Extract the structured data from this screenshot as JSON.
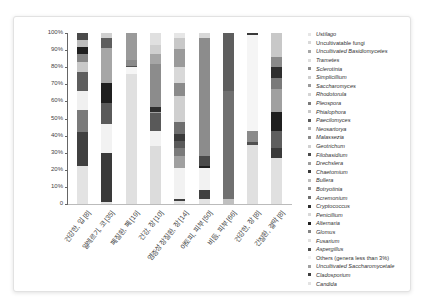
{
  "chart_data": {
    "type": "bar",
    "stacked": true,
    "title": "",
    "xlabel": "",
    "ylabel": "",
    "ylim": [
      0,
      100
    ],
    "yticks": [
      "0",
      "10%",
      "20%",
      "30%",
      "40%",
      "50%",
      "60%",
      "70%",
      "80%",
      "90%",
      "100%"
    ],
    "categories": [
      "건강한, 입 [8]",
      "알레르기, 코 [35]",
      "폐질환, 폐 [19]",
      "건강, 장 [10]",
      "염증성 장질환, 장 [14]",
      "아토피, 피부 [50]",
      "비듬, 피부 [66]",
      "건강한, 장 [8]",
      "간질환, 결막 [8]"
    ],
    "legend": [
      {
        "name": "Ustilago",
        "color": "#e6e6e6",
        "italic": true
      },
      {
        "name": "Uncultivatable fungi",
        "color": "#d9d9d9",
        "italic": false
      },
      {
        "name": "Uncultivated Basidiomycetes",
        "color": "#a6a6a6",
        "italic": true
      },
      {
        "name": "Trametes",
        "color": "#dedede",
        "italic": true
      },
      {
        "name": "Sclerotinia",
        "color": "#8c8c8c",
        "italic": true
      },
      {
        "name": "Simplicillium",
        "color": "#cfcfcf",
        "italic": true
      },
      {
        "name": "Saccharomyces",
        "color": "#9a9a9a",
        "italic": true
      },
      {
        "name": "Rhodotorula",
        "color": "#d4d4d4",
        "italic": true
      },
      {
        "name": "Pleospora",
        "color": "#7a7a7a",
        "italic": true
      },
      {
        "name": "Phialophora",
        "color": "#c8c8c8",
        "italic": true
      },
      {
        "name": "Paecilomyces",
        "color": "#5a5a5a",
        "italic": true
      },
      {
        "name": "Neosartorya",
        "color": "#b0b0b0",
        "italic": true
      },
      {
        "name": "Malassezia",
        "color": "#8a8a8a",
        "italic": true
      },
      {
        "name": "Geotrichum",
        "color": "#d0d0d0",
        "italic": true
      },
      {
        "name": "Filobasidium",
        "color": "#4a4a4a",
        "italic": true
      },
      {
        "name": "Drechslera",
        "color": "#9e9e9e",
        "italic": true
      },
      {
        "name": "Chaetomium",
        "color": "#3a3a3a",
        "italic": true
      },
      {
        "name": "Bullera",
        "color": "#bdbdbd",
        "italic": true
      },
      {
        "name": "Botryotinia",
        "color": "#939393",
        "italic": true
      },
      {
        "name": "Acremonium",
        "color": "#6e6e6e",
        "italic": true
      },
      {
        "name": "Cryptococcus",
        "color": "#2e2e2e",
        "italic": true
      },
      {
        "name": "Penicillium",
        "color": "#d8d8d8",
        "italic": true
      },
      {
        "name": "Alternaria",
        "color": "#1f1f1f",
        "italic": true
      },
      {
        "name": "Glomus",
        "color": "#858585",
        "italic": true
      },
      {
        "name": "Fusarium",
        "color": "#e0e0e0",
        "italic": true
      },
      {
        "name": "Aspergillus",
        "color": "#505050",
        "italic": true
      },
      {
        "name": "Others (genera less than 3%)",
        "color": "#f2f2f2",
        "italic": false
      },
      {
        "name": "Uncultivated Saccharomycetale",
        "color": "#a0a0a0",
        "italic": true
      },
      {
        "name": "Cladosporium",
        "color": "#404040",
        "italic": true
      },
      {
        "name": "Candida",
        "color": "#e3e3e3",
        "italic": true
      }
    ],
    "series_by_bar": [
      {
        "category": "건강한, 입 [8]",
        "segments": [
          {
            "name": "Candida",
            "value": 22,
            "color": "#e3e3e3"
          },
          {
            "name": "Cladosporium",
            "value": 20,
            "color": "#404040"
          },
          {
            "name": "Uncultivated Saccharomycetale",
            "value": 13,
            "color": "#7a7a7a"
          },
          {
            "name": "Others (genera less than 3%)",
            "value": 11,
            "color": "#f0f0f0"
          },
          {
            "name": "Aspergillus",
            "value": 11,
            "color": "#5e5e5e"
          },
          {
            "name": "Fusarium",
            "value": 6,
            "color": "#c8c8c8"
          },
          {
            "name": "Glomus",
            "value": 5,
            "color": "#858585"
          },
          {
            "name": "Alternaria",
            "value": 4,
            "color": "#1f1f1f"
          },
          {
            "name": "Penicillium",
            "value": 4,
            "color": "#bdbdbd"
          },
          {
            "name": "Cryptococcus",
            "value": 4,
            "color": "#4a4a4a"
          }
        ]
      },
      {
        "category": "알레르기, 코 [35]",
        "segments": [
          {
            "name": "Candida",
            "value": 1,
            "color": "#e3e3e3"
          },
          {
            "name": "Cladosporium",
            "value": 29,
            "color": "#3a3a3a"
          },
          {
            "name": "Others (genera less than 3%)",
            "value": 17,
            "color": "#f2f2f2"
          },
          {
            "name": "Aspergillus",
            "value": 12,
            "color": "#5a5a5a"
          },
          {
            "name": "Alternaria",
            "value": 12,
            "color": "#1f1f1f"
          },
          {
            "name": "Penicillium",
            "value": 20,
            "color": "#a6a6a6"
          },
          {
            "name": "Acremonium",
            "value": 6,
            "color": "#5e5e5e"
          },
          {
            "name": "Ustilago",
            "value": 3,
            "color": "#d0d0d0"
          }
        ]
      },
      {
        "category": "폐질환, 폐 [19]",
        "segments": [
          {
            "name": "Candida",
            "value": 76,
            "color": "#e0e0e0"
          },
          {
            "name": "Others (genera less than 3%)",
            "value": 4,
            "color": "#f5f5f5"
          },
          {
            "name": "Aspergillus",
            "value": 1,
            "color": "#505050"
          },
          {
            "name": "Uncultivated Saccharomycetale",
            "value": 3,
            "color": "#8a8a8a"
          },
          {
            "name": "Saccharomyces",
            "value": 16,
            "color": "#9a9a9a"
          }
        ]
      },
      {
        "category": "건강, 장 [10]",
        "segments": [
          {
            "name": "Candida",
            "value": 34,
            "color": "#dcdcdc"
          },
          {
            "name": "Others (genera less than 3%)",
            "value": 9,
            "color": "#f2f2f2"
          },
          {
            "name": "Cladosporium",
            "value": 10,
            "color": "#595959"
          },
          {
            "name": "Aspergillus",
            "value": 1,
            "color": "#a0a0a0"
          },
          {
            "name": "Alternaria",
            "value": 3,
            "color": "#2e2e2e"
          },
          {
            "name": "Saccharomyces",
            "value": 25,
            "color": "#8c8c8c"
          },
          {
            "name": "Sclerotinia",
            "value": 6,
            "color": "#a6a6a6"
          },
          {
            "name": "Trametes",
            "value": 5,
            "color": "#cfcfcf"
          },
          {
            "name": "Ustilago",
            "value": 7,
            "color": "#e0e0e0"
          }
        ]
      },
      {
        "category": "염증성 장질환, 장 [14]",
        "segments": [
          {
            "name": "Candida",
            "value": 2,
            "color": "#e3e3e3"
          },
          {
            "name": "Cladosporium",
            "value": 1,
            "color": "#404040"
          },
          {
            "name": "Others (genera less than 3%)",
            "value": 18,
            "color": "#f2f2f2"
          },
          {
            "name": "Glomus",
            "value": 7,
            "color": "#a0a0a0"
          },
          {
            "name": "Alternaria",
            "value": 5,
            "color": "#7a7a7a"
          },
          {
            "name": "Cryptococcus",
            "value": 4,
            "color": "#5a5a5a"
          },
          {
            "name": "Chaetomium",
            "value": 4,
            "color": "#3a3a3a"
          },
          {
            "name": "Filobasidium",
            "value": 7,
            "color": "#6e6e6e"
          },
          {
            "name": "Geotrichum",
            "value": 15,
            "color": "#cfcfcf"
          },
          {
            "name": "Malassezia",
            "value": 8,
            "color": "#8a8a8a"
          },
          {
            "name": "Neosartorya",
            "value": 9,
            "color": "#d8d8d8"
          },
          {
            "name": "Paecilomyces",
            "value": 11,
            "color": "#9a9a9a"
          },
          {
            "name": "Phialophora",
            "value": 6,
            "color": "#c8c8c8"
          },
          {
            "name": "Ustilago",
            "value": 3,
            "color": "#e6e6e6"
          }
        ]
      },
      {
        "category": "아토피, 피부 [50]",
        "segments": [
          {
            "name": "Candida",
            "value": 3,
            "color": "#e3e3e3"
          },
          {
            "name": "Cladosporium",
            "value": 5,
            "color": "#404040"
          },
          {
            "name": "Others (genera less than 3%)",
            "value": 13,
            "color": "#f2f2f2"
          },
          {
            "name": "Alternaria",
            "value": 1,
            "color": "#1f1f1f"
          },
          {
            "name": "Cryptococcus",
            "value": 6,
            "color": "#4a4a4a"
          },
          {
            "name": "Malassezia",
            "value": 69,
            "color": "#8c8c8c"
          },
          {
            "name": "Ustilago",
            "value": 3,
            "color": "#d8d8d8"
          }
        ]
      },
      {
        "category": "비듬, 피부 [66]",
        "segments": [
          {
            "name": "Candida",
            "value": 3,
            "color": "#c0c0c0"
          },
          {
            "name": "Malassezia",
            "value": 62,
            "color": "#707070"
          },
          {
            "name": "Filobasidium",
            "value": 33,
            "color": "#5e5e5e"
          }
        ]
      },
      {
        "category": "건강한, 장 [8]",
        "segments": [
          {
            "name": "Candida",
            "value": 34,
            "color": "#e0e0e0"
          },
          {
            "name": "Cladosporium",
            "value": 2,
            "color": "#505050"
          },
          {
            "name": "Uncultivated Saccharomycetale",
            "value": 6,
            "color": "#8a8a8a"
          },
          {
            "name": "Others (genera less than 3%)",
            "value": 56,
            "color": "#f5f5f5"
          },
          {
            "name": "Paecilomyces",
            "value": 1,
            "color": "#3a3a3a"
          }
        ]
      },
      {
        "category": "간질환, 결막 [8]",
        "segments": [
          {
            "name": "Candida",
            "value": 27,
            "color": "#e0e0e0"
          },
          {
            "name": "Cladosporium",
            "value": 6,
            "color": "#3a3a3a"
          },
          {
            "name": "Aspergillus",
            "value": 10,
            "color": "#5e5e5e"
          },
          {
            "name": "Alternaria",
            "value": 11,
            "color": "#1f1f1f"
          },
          {
            "name": "Glomus",
            "value": 13,
            "color": "#a0a0a0"
          },
          {
            "name": "Malassezia",
            "value": 7,
            "color": "#7a7a7a"
          },
          {
            "name": "Chaetomium",
            "value": 6,
            "color": "#2e2e2e"
          },
          {
            "name": "Paecilomyces",
            "value": 6,
            "color": "#8a8a8a"
          },
          {
            "name": "Ustilago",
            "value": 14,
            "color": "#c8c8c8"
          }
        ]
      }
    ]
  }
}
